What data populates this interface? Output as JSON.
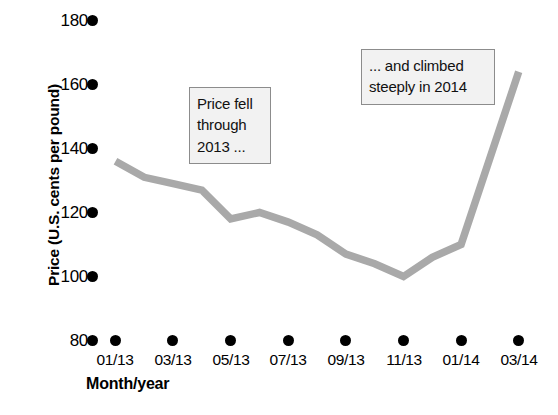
{
  "chart_data": {
    "type": "line",
    "title": "",
    "xlabel": "Month/year",
    "ylabel": "Price (U.S. cents per pound)",
    "x": [
      "01/13",
      "03/13",
      "05/13",
      "07/13",
      "09/13",
      "11/13",
      "01/14",
      "03/14"
    ],
    "xtick_labels": [
      "01/13",
      "03/13",
      "05/13",
      "07/13",
      "09/13",
      "11/13",
      "01/14",
      "03/14"
    ],
    "ytick_labels": [
      "180",
      "160",
      "140",
      "120",
      "100",
      "80"
    ],
    "yticks": [
      180,
      160,
      140,
      120,
      100,
      80
    ],
    "ylim": [
      80,
      180
    ],
    "grid": false,
    "legend": "none",
    "series": [
      {
        "name": "Price",
        "color": "#a9a9a9",
        "values": [
          136,
          131,
          127,
          118,
          113,
          100,
          110,
          164
        ],
        "points": [
          {
            "x": "01/13",
            "y": 136
          },
          {
            "x": "02/13",
            "y": 131
          },
          {
            "x": "03/13",
            "y": 129
          },
          {
            "x": "04/13",
            "y": 127
          },
          {
            "x": "05/13",
            "y": 118
          },
          {
            "x": "06/13",
            "y": 120
          },
          {
            "x": "07/13",
            "y": 117
          },
          {
            "x": "08/13",
            "y": 113
          },
          {
            "x": "09/13",
            "y": 107
          },
          {
            "x": "10/13",
            "y": 104
          },
          {
            "x": "11/13",
            "y": 100
          },
          {
            "x": "12/13",
            "y": 106
          },
          {
            "x": "01/14",
            "y": 110
          },
          {
            "x": "03/14",
            "y": 164
          }
        ]
      }
    ],
    "annotations": [
      {
        "id": "fell",
        "text": "Price fell through 2013 ...",
        "lines": [
          "Price fell",
          "through",
          "2013 ..."
        ]
      },
      {
        "id": "climbed",
        "text": "... and climbed steeply in 2014",
        "lines": [
          "... and climbed",
          "steeply in 2014"
        ]
      }
    ]
  },
  "axis": {
    "y_title": "Price (U.S. cents per pound)",
    "x_title": "Month/year"
  },
  "annotations": {
    "fell": {
      "line1": "Price fell",
      "line2": "through",
      "line3": "2013 ..."
    },
    "climbed": {
      "line1": "... and climbed",
      "line2": "steeply in 2014"
    }
  },
  "colors": {
    "series_line": "#a9a9a9",
    "tick_marker": "#000000",
    "annotation_fill": "#f2f2f2",
    "annotation_border": "#8c8c8c"
  }
}
